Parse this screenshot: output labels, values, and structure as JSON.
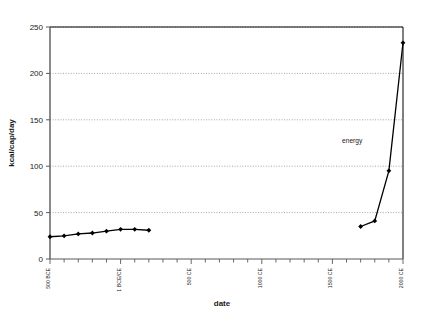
{
  "chart_data": {
    "type": "line",
    "title": "",
    "xlabel": "date",
    "ylabel": "kcal/cap/day",
    "ylim": [
      0,
      250
    ],
    "ytick_values": [
      0,
      50,
      100,
      150,
      200,
      250
    ],
    "ytick_labels": [
      "0",
      "50",
      "100",
      "150",
      "200",
      "250"
    ],
    "xlim": [
      -500,
      2000
    ],
    "xtick_interval_years": 100,
    "xtick_labels": [
      "500 BCE",
      "1 BCE/CE",
      "500 CE",
      "1000 CE",
      "1500 CE",
      "2000 CE"
    ],
    "xtick_label_values": [
      -500,
      0,
      500,
      1000,
      1500,
      2000
    ],
    "grid": "horizontal-dotted",
    "legend": "none",
    "annotations": [
      {
        "text": "energy",
        "x": 1640,
        "y": 125
      }
    ],
    "series": [
      {
        "name": "energy",
        "marker": "diamond",
        "color": "#000000",
        "segments": [
          {
            "x": [
              -500,
              -400,
              -300,
              -200,
              -100,
              0,
              100,
              200
            ],
            "y": [
              24,
              25,
              27,
              28,
              30,
              32,
              32,
              31
            ]
          },
          {
            "x": [
              1700,
              1800,
              1900,
              2000
            ],
            "y": [
              35,
              41,
              95,
              233
            ]
          }
        ]
      }
    ]
  },
  "axes": {
    "y_axis_title": "kcal/cap/day",
    "x_axis_title": "date"
  }
}
